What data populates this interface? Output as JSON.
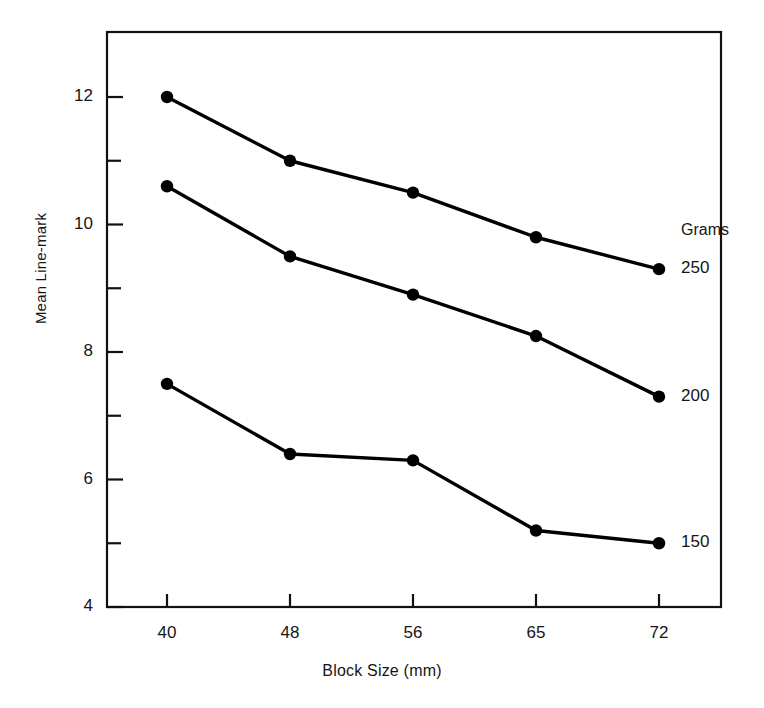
{
  "chart_data": {
    "type": "line",
    "title": "",
    "subtitle": "",
    "xlabel": "Block Size (mm)",
    "ylabel": "Mean Line-mark",
    "categories": [
      "40",
      "48",
      "56",
      "65",
      "72"
    ],
    "x": [
      40,
      48,
      56,
      65,
      72
    ],
    "xtick_labels": [
      "40",
      "48",
      "56",
      "65",
      "72"
    ],
    "ytick_labels": [
      "4",
      "6",
      "8",
      "10",
      "12"
    ],
    "ytick_values": [
      4,
      6,
      8,
      10,
      12
    ],
    "yminor_values": [
      5,
      7,
      9,
      11
    ],
    "ylim": [
      4,
      12.8
    ],
    "xlim_note": "categorical even spacing",
    "grid": false,
    "legend_title": "Grams",
    "legend_position": "right-of-line-ends",
    "marker": "filled-circle",
    "line_color": "#000000",
    "series": [
      {
        "name": "250",
        "label": "250",
        "values": [
          12.0,
          11.0,
          10.5,
          9.8,
          9.3
        ]
      },
      {
        "name": "200",
        "label": "200",
        "values": [
          10.6,
          9.5,
          8.9,
          8.25,
          7.3
        ]
      },
      {
        "name": "150",
        "label": "150",
        "values": [
          7.5,
          6.4,
          6.3,
          5.2,
          5.0
        ]
      }
    ]
  },
  "axes": {
    "y_title": "Mean Line-mark",
    "x_title": "Block Size (mm)"
  },
  "legend": {
    "title": "Grams",
    "entries": [
      {
        "label": "250"
      },
      {
        "label": "200"
      },
      {
        "label": "150"
      }
    ]
  },
  "ticks": {
    "y": [
      {
        "label": "12"
      },
      {
        "label": "10"
      },
      {
        "label": "8"
      },
      {
        "label": "6"
      },
      {
        "label": "4"
      }
    ],
    "x": [
      {
        "label": "40"
      },
      {
        "label": "48"
      },
      {
        "label": "56"
      },
      {
        "label": "65"
      },
      {
        "label": "72"
      }
    ]
  }
}
